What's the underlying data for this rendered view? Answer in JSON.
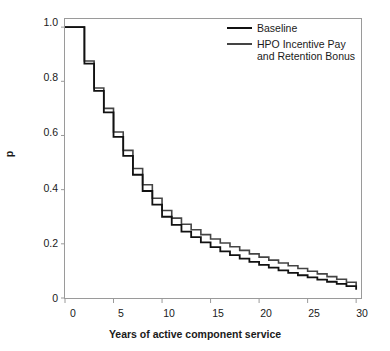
{
  "chart_data": {
    "type": "line",
    "subtype": "step",
    "title": "",
    "xlabel": "Years of active component service",
    "ylabel": "p",
    "xlim": [
      0,
      30.5
    ],
    "ylim": [
      0,
      1.03
    ],
    "xticks": [
      0,
      5,
      10,
      15,
      20,
      25,
      30
    ],
    "xticklabels": [
      "0",
      "5",
      "10",
      "15",
      "20",
      "25",
      "30"
    ],
    "yticks": [
      0,
      0.2,
      0.4,
      0.6,
      0.8,
      1.0
    ],
    "yticklabels": [
      "0",
      "0.2",
      "0.4",
      "0.6",
      "0.8",
      "1.0"
    ],
    "grid": false,
    "legend_position": "top-right",
    "frame": true,
    "x": [
      0,
      1,
      2,
      3,
      4,
      5,
      6,
      7,
      8,
      9,
      10,
      11,
      12,
      13,
      14,
      15,
      16,
      17,
      18,
      19,
      20,
      21,
      22,
      23,
      24,
      25,
      26,
      27,
      28,
      29,
      30
    ],
    "series": [
      {
        "name": "Baseline",
        "color": "#111111",
        "values": [
          1.0,
          1.0,
          0.865,
          0.765,
          0.685,
          0.595,
          0.525,
          0.455,
          0.395,
          0.345,
          0.3,
          0.27,
          0.245,
          0.225,
          0.205,
          0.188,
          0.172,
          0.158,
          0.145,
          0.133,
          0.122,
          0.112,
          0.102,
          0.093,
          0.084,
          0.076,
          0.068,
          0.06,
          0.052,
          0.044,
          0.03
        ]
      },
      {
        "name": "HPO Incentive Pay and Retention Bonus",
        "color": "#444444",
        "values": [
          1.0,
          1.0,
          0.875,
          0.775,
          0.7,
          0.613,
          0.545,
          0.478,
          0.418,
          0.368,
          0.323,
          0.295,
          0.272,
          0.252,
          0.234,
          0.218,
          0.203,
          0.189,
          0.176,
          0.163,
          0.151,
          0.14,
          0.129,
          0.119,
          0.109,
          0.099,
          0.089,
          0.079,
          0.069,
          0.058,
          0.045
        ]
      }
    ],
    "legend_entries": [
      {
        "label": "Baseline",
        "lines": [
          "Baseline"
        ]
      },
      {
        "label": "HPO Incentive Pay and Retention Bonus",
        "lines": [
          "HPO Incentive Pay",
          "and Retention Bonus"
        ]
      }
    ]
  },
  "axes": {
    "xlabel": "Years of active component service",
    "ylabel": "p",
    "xticklabels": [
      "0",
      "5",
      "10",
      "15",
      "20",
      "25",
      "30"
    ],
    "yticklabels": [
      "0",
      "0.2",
      "0.4",
      "0.6",
      "0.8",
      "1.0"
    ]
  },
  "legend": {
    "entry1_label": "Baseline",
    "entry2_line1": "HPO Incentive Pay",
    "entry2_line2": "and Retention Bonus"
  },
  "colors": {
    "baseline": "#111111",
    "hpo": "#444444",
    "frame": "#9a9a9a",
    "text": "#1a1a1a",
    "background": "#ffffff"
  }
}
